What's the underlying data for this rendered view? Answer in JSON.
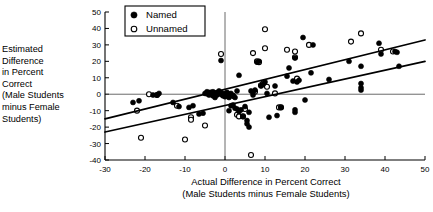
{
  "chart_data": {
    "type": "scatter",
    "title": "",
    "xlabel": "Actual Difference in Percent Correct (Male Students minus Female Students)",
    "xlabel_line1": "Actual Difference in Percent Correct",
    "xlabel_line2": "(Male Students minus Female Students)",
    "ylabel": "Estimated Difference in Percent Correct (Male Students minus Female Students)",
    "ylabel_lines": "Estimated\nDifference\nin Percent\nCorrect\n(Male Students\nminus Female\nStudents)",
    "xlim": [
      -30,
      50
    ],
    "ylim": [
      -40,
      50
    ],
    "xticks": [
      -30,
      -20,
      -10,
      0,
      10,
      20,
      30,
      40,
      50
    ],
    "xtick_labels": [
      "-30",
      "-20",
      "-10",
      "0",
      "10",
      "20",
      "30",
      "40",
      "50"
    ],
    "yticks": [
      -40,
      -30,
      -20,
      -10,
      0,
      10,
      20,
      30,
      40,
      50
    ],
    "ytick_labels": [
      "-40",
      "-30",
      "-20",
      "-10",
      "0",
      "10",
      "20",
      "30",
      "40",
      "50"
    ],
    "grid": false,
    "reference_lines": [
      {
        "name": "vertical-zero",
        "axis": "x",
        "value": 0
      },
      {
        "name": "horizontal-zero",
        "axis": "y",
        "value": 0
      }
    ],
    "legend_position": "upper-left-inside",
    "legend": [
      {
        "label": "Named",
        "marker": "filled-circle"
      },
      {
        "label": "Unnamed",
        "marker": "open-circle"
      }
    ],
    "series": [
      {
        "name": "Named",
        "marker": "filled-circle",
        "points": [
          [
            -23.0,
            -5.0
          ],
          [
            -21.5,
            -4.0
          ],
          [
            -17.0,
            -0.5
          ],
          [
            -16.5,
            0.5
          ],
          [
            -13.0,
            -5.0
          ],
          [
            -11.5,
            -7.5
          ],
          [
            -9.0,
            -8.0
          ],
          [
            -8.0,
            -7.0
          ],
          [
            -6.5,
            -12.0
          ],
          [
            -5.5,
            -11.5
          ],
          [
            -5.0,
            0.5
          ],
          [
            -4.5,
            1.5
          ],
          [
            -4.0,
            -0.5
          ],
          [
            -4.0,
            1.0
          ],
          [
            -3.5,
            0.0
          ],
          [
            -3.0,
            -1.0
          ],
          [
            -3.0,
            1.5
          ],
          [
            -2.5,
            0.5
          ],
          [
            -2.5,
            -2.0
          ],
          [
            -2.0,
            1.0
          ],
          [
            -2.0,
            -0.5
          ],
          [
            -1.5,
            0.5
          ],
          [
            -1.5,
            2.0
          ],
          [
            -1.0,
            20.5
          ],
          [
            -1.0,
            0.0
          ],
          [
            -1.0,
            1.0
          ],
          [
            -0.5,
            -1.0
          ],
          [
            -0.5,
            0.5
          ],
          [
            0.0,
            0.0
          ],
          [
            0.0,
            -1.5
          ],
          [
            0.5,
            -0.5
          ],
          [
            0.5,
            1.0
          ],
          [
            1.0,
            -0.5
          ],
          [
            1.0,
            -2.0
          ],
          [
            1.5,
            0.5
          ],
          [
            1.5,
            -7.0
          ],
          [
            2.0,
            -6.5
          ],
          [
            2.0,
            -1.0
          ],
          [
            2.5,
            -2.0
          ],
          [
            2.5,
            -8.5
          ],
          [
            3.0,
            -9.0
          ],
          [
            3.0,
            2.0
          ],
          [
            3.5,
            -10.5
          ],
          [
            3.5,
            11.5
          ],
          [
            4.0,
            -9.5
          ],
          [
            4.5,
            -13.5
          ],
          [
            5.0,
            -7.5
          ],
          [
            5.5,
            -16.0
          ],
          [
            5.5,
            -18.0
          ],
          [
            6.0,
            -11.0
          ],
          [
            6.0,
            -20.0
          ],
          [
            6.5,
            2.0
          ],
          [
            7.0,
            -0.5
          ],
          [
            7.0,
            1.0
          ],
          [
            7.5,
            2.5
          ],
          [
            8.0,
            19.5
          ],
          [
            8.5,
            20.0
          ],
          [
            9.0,
            5.0
          ],
          [
            9.5,
            6.0
          ],
          [
            10.0,
            7.5
          ],
          [
            10.5,
            0.5
          ],
          [
            11.0,
            -14.0
          ],
          [
            12.5,
            5.0
          ],
          [
            13.0,
            -13.0
          ],
          [
            14.0,
            -8.0
          ],
          [
            15.5,
            11.0
          ],
          [
            16.0,
            16.0
          ],
          [
            17.0,
            8.0
          ],
          [
            17.5,
            -11.0
          ],
          [
            17.5,
            -9.5
          ],
          [
            17.5,
            22.0
          ],
          [
            18.0,
            7.5
          ],
          [
            18.5,
            8.5
          ],
          [
            19.5,
            34.5
          ],
          [
            20.0,
            -3.5
          ],
          [
            21.5,
            13.0
          ],
          [
            22.0,
            30.0
          ],
          [
            26.0,
            9.0
          ],
          [
            31.0,
            20.0
          ],
          [
            34.0,
            4.0
          ],
          [
            34.0,
            2.5
          ],
          [
            34.0,
            6.5
          ],
          [
            34.0,
            17.0
          ],
          [
            38.5,
            31.0
          ],
          [
            39.0,
            24.5
          ],
          [
            42.5,
            26.0
          ],
          [
            43.0,
            25.5
          ],
          [
            43.5,
            17.0
          ],
          [
            -18.0,
            -0.5
          ],
          [
            1.0,
            -10.0
          ]
        ]
      },
      {
        "name": "Unnamed",
        "marker": "open-circle",
        "points": [
          [
            -22.0,
            -10.0
          ],
          [
            -21.0,
            -26.5
          ],
          [
            -17.0,
            -0.5
          ],
          [
            -12.0,
            -7.0
          ],
          [
            -10.0,
            -27.5
          ],
          [
            -8.5,
            -14.0
          ],
          [
            -8.5,
            -15.5
          ],
          [
            -5.0,
            -19.0
          ],
          [
            -4.5,
            0.5
          ],
          [
            -3.5,
            1.0
          ],
          [
            -3.0,
            -0.5
          ],
          [
            -2.0,
            0.5
          ],
          [
            -1.0,
            24.5
          ],
          [
            -0.5,
            -0.5
          ],
          [
            0.5,
            0.5
          ],
          [
            1.0,
            0.0
          ],
          [
            2.0,
            -1.0
          ],
          [
            3.0,
            -12.5
          ],
          [
            3.5,
            -13.5
          ],
          [
            4.5,
            -13.5
          ],
          [
            5.0,
            -9.0
          ],
          [
            6.5,
            -37.0
          ],
          [
            7.0,
            25.0
          ],
          [
            7.5,
            1.5
          ],
          [
            8.0,
            20.0
          ],
          [
            8.5,
            19.5
          ],
          [
            9.0,
            5.5
          ],
          [
            9.5,
            6.5
          ],
          [
            10.0,
            28.0
          ],
          [
            10.0,
            39.5
          ],
          [
            10.5,
            4.5
          ],
          [
            12.5,
            0.5
          ],
          [
            13.5,
            -8.0
          ],
          [
            14.0,
            -8.0
          ],
          [
            15.5,
            27.0
          ],
          [
            17.5,
            26.0
          ],
          [
            17.5,
            22.5
          ],
          [
            18.0,
            9.5
          ],
          [
            21.0,
            30.0
          ],
          [
            31.5,
            32.0
          ],
          [
            34.0,
            37.0
          ],
          [
            39.0,
            27.0
          ],
          [
            42.0,
            26.0
          ],
          [
            -19.0,
            0.0
          ]
        ]
      }
    ],
    "trend_lines": [
      {
        "name": "upper-regression-line",
        "x0": -30,
        "y0": -15.0,
        "x1": 50,
        "y1": 33.0
      },
      {
        "name": "lower-regression-line",
        "x0": -30,
        "y0": -23.0,
        "x1": 50,
        "y1": 20.0
      }
    ]
  }
}
